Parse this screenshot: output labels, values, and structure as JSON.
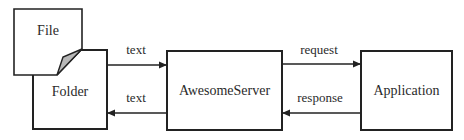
{
  "diagram": {
    "colors": {
      "stroke": "#222222",
      "fold_fill": "#b8b8b8",
      "background": "#ffffff"
    },
    "nodes": {
      "file": {
        "label": "File"
      },
      "folder": {
        "label": "Folder"
      },
      "server": {
        "label": "AwesomeServer"
      },
      "application": {
        "label": "Application"
      }
    },
    "edges": [
      {
        "from": "folder",
        "to": "server",
        "label": "text"
      },
      {
        "from": "server",
        "to": "folder",
        "label": "text"
      },
      {
        "from": "server",
        "to": "application",
        "label": "request"
      },
      {
        "from": "application",
        "to": "server",
        "label": "response"
      }
    ]
  }
}
